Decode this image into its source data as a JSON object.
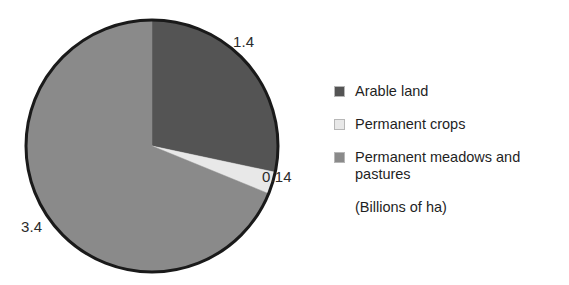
{
  "chart_data": {
    "type": "pie",
    "title": "",
    "subtitle": "",
    "unit_note": "(Billions of ha)",
    "categories": [
      "Arable land",
      "Permanent crops",
      "Permanent meadows and pastures"
    ],
    "values": [
      1.4,
      0.14,
      3.4
    ],
    "value_labels": [
      "1.4",
      "0.14",
      "3.4"
    ],
    "colors": [
      "#545454",
      "#e8e8e8",
      "#8a8a8a"
    ],
    "total": 4.94,
    "start_angle_deg": 0,
    "direction": "clockwise",
    "legend_position": "right",
    "grid": false
  },
  "pie": {
    "outline_color": "#1a1a1a",
    "background": "#ffffff",
    "center_x": 152,
    "center_y": 146,
    "radius": 126,
    "labels": {
      "arable": "1.4",
      "crops": "0.14",
      "meadows": "3.4"
    }
  },
  "legend": {
    "items": [
      {
        "label": "Arable land",
        "color": "#545454",
        "swatch_name": "legend-swatch-arable"
      },
      {
        "label": "Permanent crops",
        "color": "#e8e8e8",
        "swatch_name": "legend-swatch-crops"
      },
      {
        "label": "Permanent meadows and pastures",
        "color": "#8a8a8a",
        "swatch_name": "legend-swatch-meadows"
      }
    ],
    "note": "(Billions of ha)"
  }
}
